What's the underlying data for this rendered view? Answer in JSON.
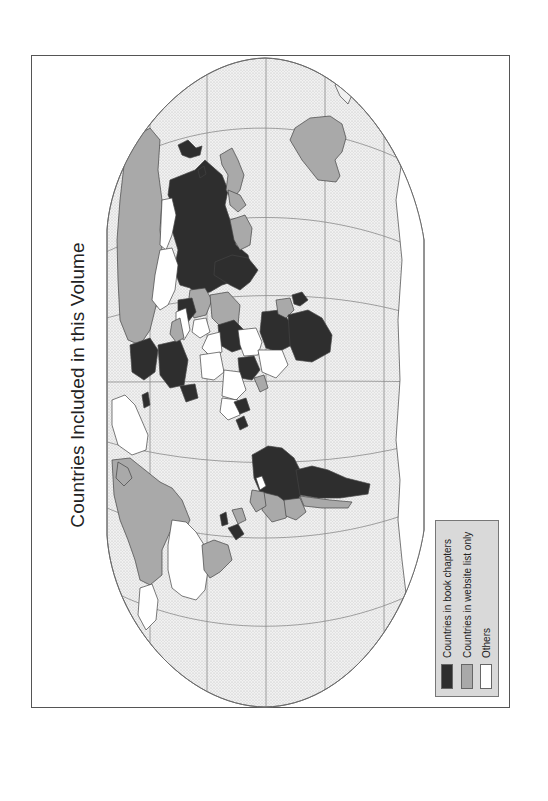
{
  "map": {
    "title": "Countries Included in this Volume",
    "orientation": "rotated 90 degrees counter-clockwise (north pointing left)",
    "colors": {
      "ocean": "#eeeeee",
      "graticule": "#8a8a8a",
      "book_chapters": "#2e2e2e",
      "website_list_only": "#a9a9a9",
      "others": "#ffffff",
      "border": "#444444"
    }
  },
  "legend": {
    "items": [
      {
        "label": "Countries in book chapters",
        "color": "#2e2e2e"
      },
      {
        "label": "Countries in website list only",
        "color": "#a9a9a9"
      },
      {
        "label": "Others",
        "color": "#ffffff"
      }
    ]
  }
}
